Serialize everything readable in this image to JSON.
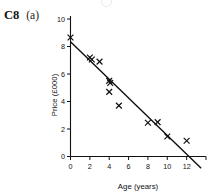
{
  "question": {
    "code": "C8",
    "part": "(a)"
  },
  "chart_data": {
    "type": "scatter",
    "title": "",
    "subtitle": "",
    "xlabel": "Age (years)",
    "ylabel": "Price (£000)",
    "xlim": [
      0,
      14
    ],
    "ylim": [
      0,
      10
    ],
    "xticks": [
      0,
      2,
      4,
      6,
      8,
      10,
      12,
      14
    ],
    "xtick_labels": [
      "0",
      "2",
      "4",
      "6",
      "8",
      "10",
      "12",
      ""
    ],
    "yticks": [
      0,
      2,
      4,
      6,
      8,
      10
    ],
    "ytick_labels": [
      "0",
      "2",
      "4",
      "6",
      "8",
      "10"
    ],
    "grid": false,
    "legend": null,
    "marker_style": "x",
    "series": [
      {
        "name": "Car price vs age",
        "marker": "x",
        "points": [
          {
            "x": 0,
            "y": 8.65
          },
          {
            "x": 2,
            "y": 7.2
          },
          {
            "x": 2.2,
            "y": 7.05
          },
          {
            "x": 3,
            "y": 6.9
          },
          {
            "x": 4,
            "y": 5.5
          },
          {
            "x": 4.1,
            "y": 5.35
          },
          {
            "x": 4,
            "y": 4.7
          },
          {
            "x": 5,
            "y": 3.7
          },
          {
            "x": 8,
            "y": 2.45
          },
          {
            "x": 9,
            "y": 2.5
          },
          {
            "x": 10,
            "y": 1.45
          },
          {
            "x": 12,
            "y": 1.15
          }
        ]
      }
    ],
    "fit_line": {
      "type": "linear-regression",
      "label": "line of best fit",
      "x_start": 0,
      "y_start": 8.35,
      "x_end": 13.5,
      "y_end": -0.85,
      "visible_intercept_y": 8.35,
      "x_axis_crossing": 12.3
    }
  }
}
